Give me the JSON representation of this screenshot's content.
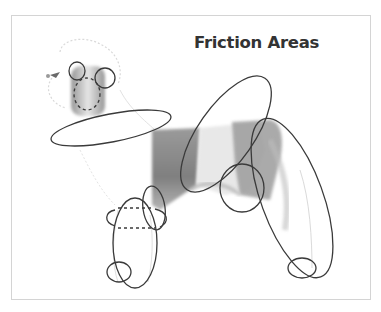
{
  "figure": {
    "title": "Friction Areas",
    "colors": {
      "outline": "#3a3a3a",
      "title": "#333333",
      "frame_border": "#d4d4d4",
      "fur_dark": "#8a8a8a",
      "fur_light": "#cfcfcf"
    },
    "friction_areas": [
      {
        "name": "ear-left",
        "style": "solid"
      },
      {
        "name": "ear-right",
        "style": "solid"
      },
      {
        "name": "muzzle",
        "style": "dashed"
      },
      {
        "name": "neck",
        "style": "solid"
      },
      {
        "name": "shoulder",
        "style": "solid"
      },
      {
        "name": "flank",
        "style": "solid"
      },
      {
        "name": "rear-leg",
        "style": "solid"
      },
      {
        "name": "rear-foot",
        "style": "solid"
      },
      {
        "name": "front-leg",
        "style": "solid"
      },
      {
        "name": "front-leg-band",
        "style": "dashed-front"
      },
      {
        "name": "elbow",
        "style": "solid"
      },
      {
        "name": "front-foot",
        "style": "solid"
      }
    ]
  }
}
